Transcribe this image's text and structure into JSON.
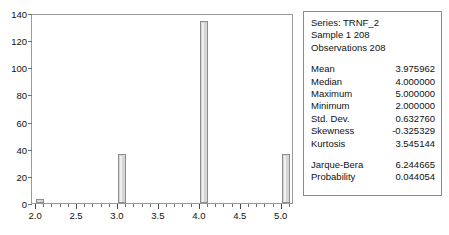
{
  "chart_data": {
    "type": "bar",
    "title": "",
    "xlabel": "",
    "ylabel": "",
    "x": [
      2.0,
      3.0,
      4.0,
      5.0
    ],
    "categories": [
      "2.0",
      "3.0",
      "4.0",
      "5.0"
    ],
    "values": [
      3,
      36,
      134,
      36
    ],
    "bar_width": 0.1,
    "xlim": [
      1.95,
      5.15
    ],
    "ylim": [
      0,
      140
    ],
    "xticks": [
      2.0,
      2.5,
      3.0,
      3.5,
      4.0,
      4.5,
      5.0
    ],
    "xtick_labels": [
      "2.0",
      "2.5",
      "3.0",
      "3.5",
      "4.0",
      "4.5",
      "5.0"
    ],
    "yticks": [
      0,
      20,
      40,
      60,
      80,
      100,
      120,
      140
    ],
    "ytick_labels": [
      "0",
      "20",
      "40",
      "60",
      "80",
      "100",
      "120",
      "140"
    ],
    "grid": false,
    "legend": "none",
    "bar_fill_color": "#d6d6d6",
    "bar_edge_color": "#8d8d8d",
    "frame_color": "#9a9a9a"
  },
  "stats_panel": {
    "header": [
      "Series: TRNF_2",
      "Sample 1 208",
      "Observations 208"
    ],
    "moments": [
      {
        "label": "Mean",
        "value": "3.975962"
      },
      {
        "label": "Median",
        "value": "4.000000"
      },
      {
        "label": "Maximum",
        "value": "5.000000"
      },
      {
        "label": "Minimum",
        "value": "2.000000"
      },
      {
        "label": "Std. Dev.",
        "value": "0.632760"
      },
      {
        "label": "Skewness",
        "value": "-0.325329"
      },
      {
        "label": "Kurtosis",
        "value": "3.545144"
      }
    ],
    "tests": [
      {
        "label": "Jarque-Bera",
        "value": "6.244665"
      },
      {
        "label": "Probability",
        "value": "0.044054"
      }
    ]
  }
}
